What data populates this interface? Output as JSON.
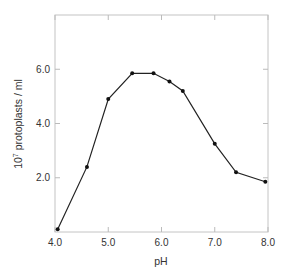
{
  "chart_data": {
    "type": "line",
    "title": "",
    "xlabel": "pH",
    "ylabel": "10^7 protoplasts / ml",
    "ylabel_parts": {
      "base": "10",
      "exponent": "7",
      "rest": " protoplasts / ml"
    },
    "xlim": [
      4.0,
      8.0
    ],
    "ylim": [
      0,
      8.0
    ],
    "x_ticks": [
      4.0,
      5.0,
      6.0,
      7.0,
      8.0
    ],
    "x_tick_labels": [
      "4.0",
      "5.0",
      "6.0",
      "7.0",
      "8.0"
    ],
    "y_ticks": [
      2.0,
      4.0,
      6.0
    ],
    "y_tick_labels": [
      "2.0",
      "4.0",
      "6.0"
    ],
    "grid": false,
    "legend": null,
    "series": [
      {
        "name": "protoplast yield",
        "x": [
          4.05,
          4.6,
          5.0,
          5.45,
          5.85,
          6.15,
          6.4,
          7.0,
          7.4,
          7.95
        ],
        "y": [
          0.1,
          2.4,
          4.9,
          5.85,
          5.85,
          5.55,
          5.2,
          3.25,
          2.2,
          1.85
        ]
      }
    ],
    "colors": {
      "line": "#222222",
      "marker": "#111111",
      "frame": "#bdbdbd"
    }
  }
}
